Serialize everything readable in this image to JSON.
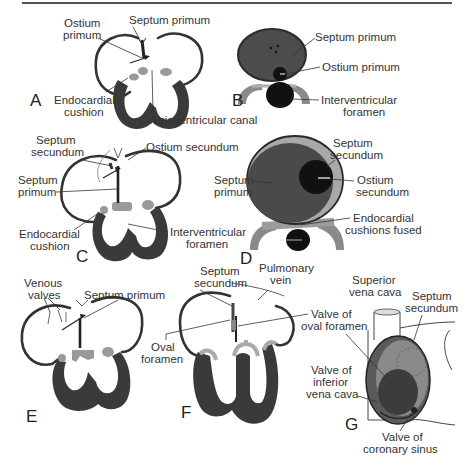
{
  "figure": {
    "colors": {
      "myocardium": "#3a3a3a",
      "cushion": "#9a9a9a",
      "septum_dark": "#4a4a4a",
      "foramen_black": "#111111",
      "line": "#333333",
      "background": "#ffffff"
    }
  },
  "panels": {
    "A": {
      "letter": "A",
      "labels": {
        "ostium_primum_1": "Ostium",
        "ostium_primum_2": "primum",
        "septum_primum": "Septum primum",
        "endocardial_cushion_1": "Endocardial",
        "endocardial_cushion_2": "cushion",
        "atrioventricular_canal": "Atrioventricular canal"
      }
    },
    "B": {
      "letter": "B",
      "labels": {
        "septum_primum": "Septum primum",
        "ostium_primum": "Ostium primum",
        "interventricular_foramen_1": "Interventricular",
        "interventricular_foramen_2": "foramen"
      }
    },
    "C": {
      "letter": "C",
      "labels": {
        "septum_secundum_1": "Septum",
        "septum_secundum_2": "secundum",
        "ostium_secundum": "Ostium secundum",
        "septum_primum_1": "Septum",
        "septum_primum_2": "primum",
        "endocardial_cushion_1": "Endocardial",
        "endocardial_cushion_2": "cushion",
        "interventricular_foramen_1": "Interventricular",
        "interventricular_foramen_2": "foramen"
      }
    },
    "D": {
      "letter": "D",
      "labels": {
        "septum_secundum_1": "Septum",
        "septum_secundum_2": "secundum",
        "septum_primum_1": "Septum",
        "septum_primum_2": "primum",
        "ostium_secundum_1": "Ostium",
        "ostium_secundum_2": "secundum",
        "endocardial_cushions_fused_1": "Endocardial",
        "endocardial_cushions_fused_2": "cushions fused"
      }
    },
    "E": {
      "letter": "E",
      "labels": {
        "venous_valves_1": "Venous",
        "venous_valves_2": "valves",
        "septum_primum": "Septum primum"
      }
    },
    "F": {
      "letter": "F",
      "labels": {
        "septum_secundum_1": "Septum",
        "septum_secundum_2": "secundum",
        "pulmonary_vein_1": "Pulmonary",
        "pulmonary_vein_2": "vein",
        "valve_oval_foramen_1": "Valve of",
        "valve_oval_foramen_2": "oval foramen",
        "oval_foramen_1": "Oval",
        "oval_foramen_2": "foramen"
      }
    },
    "G": {
      "letter": "G",
      "labels": {
        "superior_vena_cava_1": "Superior",
        "superior_vena_cava_2": "vena cava",
        "septum_secundum_1": "Septum",
        "septum_secundum_2": "secundum",
        "valve_inferior_vena_cava_1": "Valve of",
        "valve_inferior_vena_cava_2": "inferior",
        "valve_inferior_vena_cava_3": "vena cava",
        "valve_coronary_sinus_1": "Valve of",
        "valve_coronary_sinus_2": "coronary sinus"
      }
    }
  }
}
